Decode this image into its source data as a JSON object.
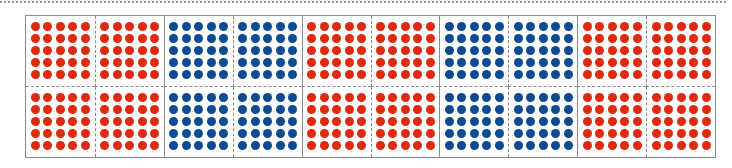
{
  "figure": {
    "rows": 2,
    "columns": 10,
    "dots_per_side": 5,
    "colors": {
      "red": "#e0290e",
      "blue": "#0d4a94",
      "border": "#8a8a8a"
    },
    "column_colors": [
      "red",
      "red",
      "blue",
      "blue",
      "red",
      "red",
      "blue",
      "blue",
      "red",
      "red"
    ],
    "dots_per_cell": 25,
    "total_cells": 20,
    "total_dots": 500
  }
}
